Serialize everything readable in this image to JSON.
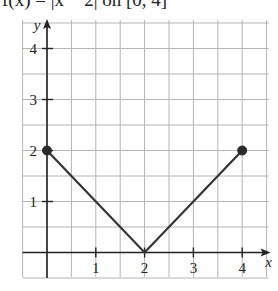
{
  "header": {
    "text": "f(x) = |x − 2| on [0, 4]"
  },
  "chart_data": {
    "type": "line",
    "title": "f(x) = |x − 2| on [0, 4]",
    "xlabel": "x",
    "ylabel": "y",
    "xlim": [
      -0.5,
      4.5
    ],
    "ylim": [
      -0.5,
      4.5
    ],
    "grid": true,
    "grid_step": 0.5,
    "x_ticks": [
      "1",
      "2",
      "3",
      "4"
    ],
    "y_ticks": [
      "1",
      "2",
      "3",
      "4"
    ],
    "series": [
      {
        "name": "f(x) = |x − 2|",
        "x": [
          0,
          2,
          4
        ],
        "y": [
          2,
          0,
          2
        ],
        "color": "#333333"
      }
    ],
    "endpoints": [
      {
        "x": 0,
        "y": 2,
        "style": "filled"
      },
      {
        "x": 4,
        "y": 2,
        "style": "filled"
      }
    ],
    "legend": null
  },
  "colors": {
    "grid": "#b4b4b4",
    "axis": "#222222",
    "curve": "#333333"
  }
}
